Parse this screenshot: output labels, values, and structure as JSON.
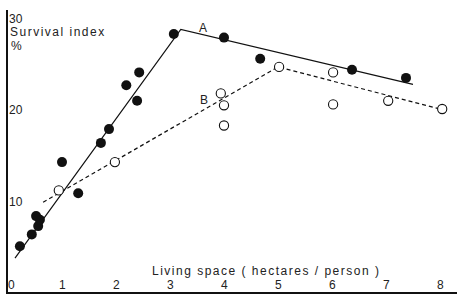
{
  "chart_data": {
    "type": "scatter",
    "title": "",
    "xlabel": "Living space ( hectares / person )",
    "ylabel": "Survival index",
    "ylabel_unit": "%",
    "xlim": [
      0,
      8.3
    ],
    "ylim": [
      0,
      30
    ],
    "x_ticks": [
      "0",
      "1",
      "2",
      "3",
      "4",
      "5",
      "6",
      "7",
      "8"
    ],
    "y_ticks": [
      "10",
      "20",
      "30"
    ],
    "grid": false,
    "legend": "none; series labelled inline",
    "series": [
      {
        "name": "A",
        "marker": "filled-circle",
        "line_style": "solid",
        "points": [
          {
            "x": 0.22,
            "y": 5.0
          },
          {
            "x": 0.44,
            "y": 6.3
          },
          {
            "x": 0.56,
            "y": 7.2
          },
          {
            "x": 0.59,
            "y": 7.9
          },
          {
            "x": 0.52,
            "y": 8.3
          },
          {
            "x": 1.0,
            "y": 14.2
          },
          {
            "x": 1.3,
            "y": 10.8
          },
          {
            "x": 1.72,
            "y": 16.3
          },
          {
            "x": 1.87,
            "y": 17.8
          },
          {
            "x": 2.19,
            "y": 22.6
          },
          {
            "x": 2.39,
            "y": 20.9
          },
          {
            "x": 2.43,
            "y": 24.0
          },
          {
            "x": 3.07,
            "y": 28.2
          },
          {
            "x": 4.0,
            "y": 27.8
          },
          {
            "x": 4.67,
            "y": 25.5
          },
          {
            "x": 6.37,
            "y": 24.3
          },
          {
            "x": 7.37,
            "y": 23.4
          }
        ],
        "fit_line": [
          {
            "x": 0.13,
            "y": 3.7
          },
          {
            "x": 3.2,
            "y": 28.7
          },
          {
            "x": 7.5,
            "y": 22.7
          }
        ]
      },
      {
        "name": "B",
        "marker": "open-circle",
        "line_style": "dashed",
        "points": [
          {
            "x": 0.94,
            "y": 11.1
          },
          {
            "x": 1.98,
            "y": 14.2
          },
          {
            "x": 3.94,
            "y": 21.7
          },
          {
            "x": 4.0,
            "y": 20.4
          },
          {
            "x": 4.0,
            "y": 18.2
          },
          {
            "x": 5.02,
            "y": 24.6
          },
          {
            "x": 6.02,
            "y": 24.0
          },
          {
            "x": 6.02,
            "y": 20.5
          },
          {
            "x": 7.04,
            "y": 20.9
          },
          {
            "x": 8.04,
            "y": 20.0
          }
        ],
        "fit_line": [
          {
            "x": 0.65,
            "y": 9.8
          },
          {
            "x": 5.0,
            "y": 24.6
          },
          {
            "x": 8.0,
            "y": 20.0
          }
        ]
      }
    ]
  },
  "labels": {
    "y_axis_title": "Survival index",
    "y_axis_unit": "%",
    "x_axis_title": "Living space ( hectares / person )",
    "series_a": "A",
    "series_b": "B"
  },
  "colors": {
    "ink": "#111111",
    "background": "#ffffff"
  }
}
